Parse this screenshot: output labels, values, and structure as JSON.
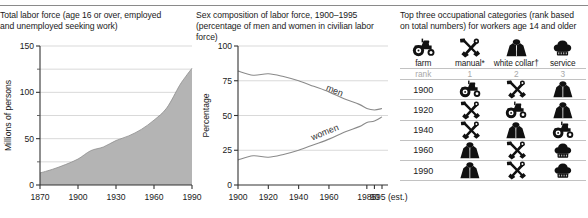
{
  "figure": {
    "panels": [
      {
        "id": "total-labor-force",
        "caption_line1": "Total labor force (age 16 or over, employed",
        "caption_line2": "and unemployed seeking work)"
      },
      {
        "id": "sex-composition",
        "caption_line1": "Sex composition of labor force, 1900–1995",
        "caption_line2": "(percentage of men and women in civilian labor force)"
      },
      {
        "id": "top-occupations",
        "caption_line1": "Top three occupational categories (rank based",
        "caption_line2": "on total numbers) for workers age 14 and older"
      }
    ]
  },
  "chart_data": [
    {
      "type": "area",
      "title": "Total labor force (age 16 or over, employed and unemployed seeking work)",
      "xlabel": "",
      "ylabel": "Millions of persons",
      "xlim": [
        1870,
        1990
      ],
      "ylim": [
        0,
        150
      ],
      "xticks": [
        1870,
        1900,
        1930,
        1960,
        1990
      ],
      "xticklabels": [
        "1870",
        "1900",
        "1930",
        "1960",
        "1990"
      ],
      "yticks": [
        0,
        50,
        100,
        150
      ],
      "yticklabels": [
        "0",
        "50",
        "100",
        "150"
      ],
      "yticks_minor": [
        25,
        75,
        125
      ],
      "grid": "horizontal",
      "fill_color": "#b4b4b4",
      "x": [
        1870,
        1880,
        1890,
        1900,
        1910,
        1920,
        1930,
        1940,
        1950,
        1960,
        1970,
        1980,
        1985,
        1990
      ],
      "values": [
        13,
        17,
        22,
        28,
        37,
        41,
        48,
        53,
        60,
        70,
        83,
        107,
        117,
        126
      ]
    },
    {
      "type": "line",
      "title": "Sex composition of labor force, 1900–1995 (percentage of men and women in civilian labor force)",
      "xlabel": "",
      "ylabel": "Percentage",
      "xlim": [
        1900,
        1995
      ],
      "ylim": [
        0,
        100
      ],
      "xticks": [
        1900,
        1920,
        1940,
        1960,
        1985,
        1990,
        1995
      ],
      "xticklabels": [
        "1900",
        "1920",
        "1940",
        "1960",
        "1985",
        "90",
        "95 (est.)"
      ],
      "yticks": [
        0,
        25,
        50,
        75,
        100
      ],
      "yticklabels": [
        "0",
        "25",
        "50",
        "75",
        "100"
      ],
      "grid": "horizontal",
      "legend": "inline-curve-labels",
      "series": [
        {
          "name": "men",
          "x": [
            1900,
            1910,
            1920,
            1930,
            1940,
            1950,
            1960,
            1970,
            1980,
            1985,
            1990,
            1995
          ],
          "values": [
            82,
            79,
            80,
            78,
            75,
            71,
            67,
            62,
            58,
            55,
            54,
            55
          ]
        },
        {
          "name": "women",
          "x": [
            1900,
            1910,
            1920,
            1930,
            1940,
            1950,
            1960,
            1970,
            1980,
            1985,
            1990,
            1995
          ],
          "values": [
            18,
            21,
            20,
            22,
            25,
            29,
            33,
            38,
            42,
            45,
            46,
            49
          ]
        }
      ]
    },
    {
      "type": "table",
      "title": "Top three occupational categories (rank based on total numbers) for workers age 14 and older",
      "categories": [
        {
          "key": "farm",
          "label": "farm",
          "icon": "tractor-icon"
        },
        {
          "key": "manual",
          "label": "manual*",
          "icon": "hammer-wrench-icon"
        },
        {
          "key": "white-collar",
          "label": "white collar†",
          "icon": "shirt-icon"
        },
        {
          "key": "service",
          "label": "service",
          "icon": "chef-hat-icon"
        }
      ],
      "rank_label": "rank",
      "ranks": [
        "1",
        "2",
        "3"
      ],
      "rows": [
        {
          "year": "1900",
          "ranked": [
            "tractor-icon",
            "hammer-wrench-icon",
            "shirt-icon"
          ]
        },
        {
          "year": "1920",
          "ranked": [
            "hammer-wrench-icon",
            "tractor-icon",
            "shirt-icon"
          ]
        },
        {
          "year": "1940",
          "ranked": [
            "hammer-wrench-icon",
            "shirt-icon",
            "tractor-icon"
          ]
        },
        {
          "year": "1960",
          "ranked": [
            "shirt-icon",
            "hammer-wrench-icon",
            "chef-hat-icon"
          ]
        },
        {
          "year": "1990",
          "ranked": [
            "shirt-icon",
            "hammer-wrench-icon",
            "chef-hat-icon"
          ]
        }
      ]
    }
  ]
}
